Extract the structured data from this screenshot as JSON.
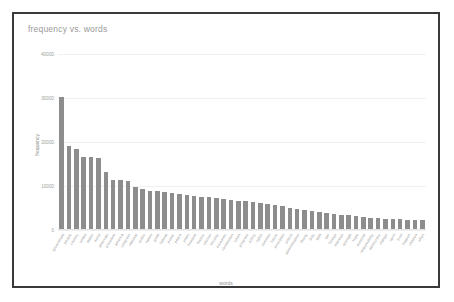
{
  "card": {
    "title": "frequency vs. words",
    "border_color": "#3a3a3a",
    "background": "#ffffff"
  },
  "chart_data": {
    "type": "bar",
    "title": "frequency vs. words",
    "xlabel": "words",
    "ylabel": "frequency",
    "ylim": [
      0,
      40000
    ],
    "yticks": [
      0,
      10000,
      20000,
      30000,
      40000
    ],
    "ytick_labels": [
      "0",
      "10000",
      "20000",
      "30000",
      "40000"
    ],
    "grid": true,
    "legend": "none",
    "bar_color": "#8d8d8d",
    "grid_color": "#f0f0f0",
    "categories": [
      "government",
      "people",
      "country",
      "united",
      "states",
      "world",
      "american",
      "president",
      "america",
      "congress",
      "national",
      "public",
      "nation",
      "great",
      "federal",
      "power",
      "peace",
      "years",
      "freedom",
      "history",
      "citizens",
      "security",
      "economic",
      "constitution",
      "union",
      "progress",
      "policy",
      "rights",
      "common",
      "future",
      "principles",
      "justice",
      "administration",
      "liberty",
      "duty",
      "faith",
      "law",
      "foreign",
      "interests",
      "strength",
      "hope",
      "purpose",
      "responsibility",
      "democracy",
      "change",
      "spirit",
      "trust",
      "support",
      "children",
      "effort"
    ],
    "values": [
      30200,
      19100,
      18300,
      16600,
      16500,
      16400,
      13200,
      11400,
      11300,
      11200,
      9800,
      9300,
      8900,
      8800,
      8600,
      8400,
      8200,
      8000,
      7800,
      7600,
      7400,
      7200,
      7000,
      6800,
      6700,
      6500,
      6300,
      6100,
      5900,
      5700,
      5500,
      4900,
      4700,
      4500,
      4300,
      4100,
      3900,
      3700,
      3500,
      3300,
      3100,
      2900,
      2800,
      2700,
      2600,
      2500,
      2400,
      2350,
      2300,
      2250
    ]
  }
}
